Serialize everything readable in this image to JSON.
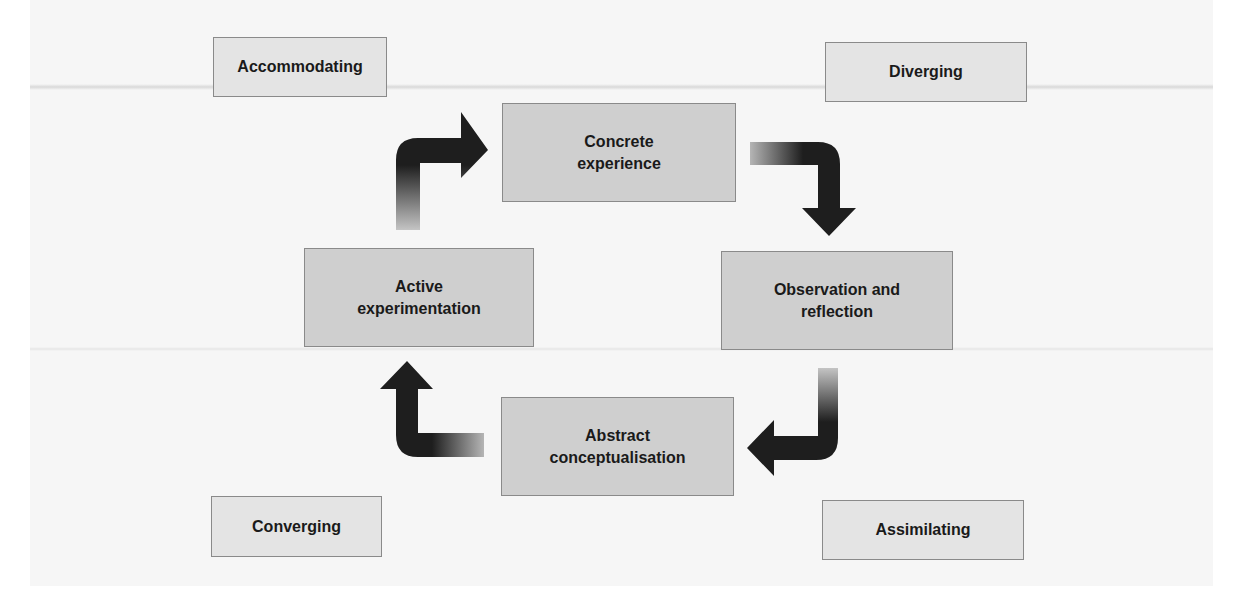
{
  "diagram": {
    "type": "cycle",
    "stages": [
      {
        "id": "concrete",
        "label": "Concrete\nexperience"
      },
      {
        "id": "observation",
        "label": "Observation and\nreflection"
      },
      {
        "id": "abstract",
        "label": "Abstract\nconceptualisation"
      },
      {
        "id": "active",
        "label": "Active\nexperimentation"
      }
    ],
    "styles": [
      {
        "id": "accommodating",
        "label": "Accommodating",
        "position": "top-left"
      },
      {
        "id": "diverging",
        "label": "Diverging",
        "position": "top-right"
      },
      {
        "id": "converging",
        "label": "Converging",
        "position": "bottom-left"
      },
      {
        "id": "assimilating",
        "label": "Assimilating",
        "position": "bottom-right"
      }
    ],
    "arrows": [
      {
        "from": "active",
        "to": "concrete",
        "direction": "clockwise"
      },
      {
        "from": "concrete",
        "to": "observation",
        "direction": "clockwise"
      },
      {
        "from": "observation",
        "to": "abstract",
        "direction": "clockwise"
      },
      {
        "from": "abstract",
        "to": "active",
        "direction": "clockwise"
      }
    ],
    "colors": {
      "stage_fill": "#cfcfcf",
      "style_fill": "#e4e4e4",
      "border": "#8a8a8a",
      "arrow_dark": "#1e1e1e",
      "arrow_light": "#bdbdbd",
      "background": "#f6f6f6"
    }
  }
}
